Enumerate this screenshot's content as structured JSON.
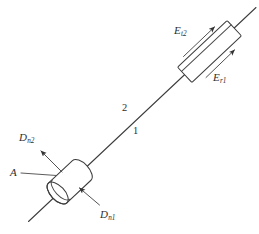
{
  "figure": {
    "type": "optics-ray-diagram",
    "background_color": "#ffffff",
    "line_color": "#3c3c3c",
    "text_color": "#2e2e2e"
  },
  "labels": {
    "et2": {
      "base": "E",
      "sub": "t2"
    },
    "et1": {
      "base": "E",
      "sub": "r1"
    },
    "dn2": {
      "base": "D",
      "sub": "n2"
    },
    "dn1": {
      "base": "D",
      "sub": "n1"
    },
    "point_a": "A",
    "ray_2": "2",
    "ray_1": "1"
  },
  "elements": {
    "upper_body": "rectangular-prism",
    "lower_body": "cylinder",
    "axis_line": "diagonal-ray-axis"
  }
}
